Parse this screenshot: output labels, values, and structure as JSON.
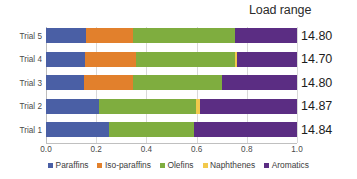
{
  "header": {
    "load_range_title": "Load range"
  },
  "axis": {
    "tick_labels": [
      "0.0",
      "0.2",
      "0.4",
      "0.6",
      "0.8",
      "1.0"
    ],
    "tick_values": [
      0.0,
      0.2,
      0.4,
      0.6,
      0.8,
      1.0
    ]
  },
  "legend": {
    "items": [
      {
        "label": "Paraffins",
        "color": "#4A5FA5"
      },
      {
        "label": "Iso-paraffins",
        "color": "#E2802C"
      },
      {
        "label": "Olefins",
        "color": "#7FAD3F"
      },
      {
        "label": "Naphthenes",
        "color": "#F2C94C"
      },
      {
        "label": "Aromatics",
        "color": "#5B2D83"
      }
    ]
  },
  "chart_data": {
    "type": "bar",
    "orientation": "horizontal",
    "stacked": true,
    "normalized": true,
    "title": "",
    "xlabel": "",
    "ylabel": "",
    "xlim": [
      0.0,
      1.0
    ],
    "grid": true,
    "legend_position": "bottom",
    "categories": [
      "Trial 5",
      "Trial 4",
      "Trial 3",
      "Trial 2",
      "Trial 1"
    ],
    "series": [
      {
        "name": "Paraffins",
        "color": "#4A5FA5",
        "values": [
          0.16,
          0.155,
          0.15,
          0.21,
          0.25
        ]
      },
      {
        "name": "Iso-paraffins",
        "color": "#E2802C",
        "values": [
          0.185,
          0.205,
          0.195,
          0.0,
          0.0
        ]
      },
      {
        "name": "Olefins",
        "color": "#7FAD3F",
        "values": [
          0.41,
          0.395,
          0.355,
          0.388,
          0.34
        ]
      },
      {
        "name": "Naphthenes",
        "color": "#F2C94C",
        "values": [
          0.0,
          0.008,
          0.0,
          0.016,
          0.0
        ]
      },
      {
        "name": "Aromatics",
        "color": "#5B2D83",
        "values": [
          0.245,
          0.237,
          0.3,
          0.386,
          0.41
        ]
      }
    ],
    "annotations": {
      "column_header": "Load range",
      "values": [
        "14.80",
        "14.70",
        "14.80",
        "14.87",
        "14.84"
      ]
    }
  }
}
